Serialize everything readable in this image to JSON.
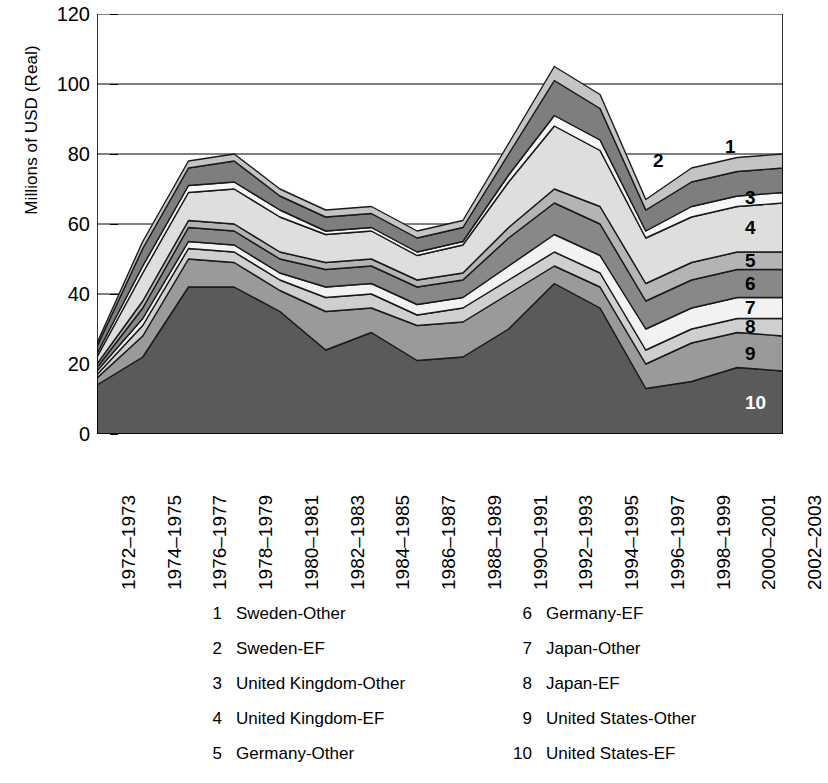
{
  "axes": {
    "y_title": "Millions of USD (Real)",
    "y_ticks": [
      "0",
      "20",
      "40",
      "60",
      "80",
      "100",
      "120"
    ],
    "x_ticks": [
      "1972–1973",
      "1974–1975",
      "1976–1977",
      "1978–1979",
      "1980–1981",
      "1982–1983",
      "1984–1985",
      "1986–1987",
      "1988–1989",
      "1990–1991",
      "1992–1993",
      "1994–1995",
      "1996–1997",
      "1998–1999",
      "2000–2001",
      "2002–2003"
    ]
  },
  "series_labels": {
    "s1": "1",
    "s2": "2",
    "s3": "3",
    "s4": "4",
    "s5": "5",
    "s6": "6",
    "s7": "7",
    "s8": "8",
    "s9": "9",
    "s10": "10"
  },
  "legend": {
    "left": [
      {
        "num": "1",
        "label": "Sweden-Other"
      },
      {
        "num": "2",
        "label": "Sweden-EF"
      },
      {
        "num": "3",
        "label": "United Kingdom-Other"
      },
      {
        "num": "4",
        "label": "United Kingdom-EF"
      },
      {
        "num": "5",
        "label": "Germany-Other"
      }
    ],
    "right": [
      {
        "num": "6",
        "label": "Germany-EF"
      },
      {
        "num": "7",
        "label": "Japan-Other"
      },
      {
        "num": "8",
        "label": "Japan-EF"
      },
      {
        "num": "9",
        "label": "United States-Other"
      },
      {
        "num": "10",
        "label": "United States-EF"
      }
    ]
  },
  "chart_data": {
    "type": "area",
    "stacked": true,
    "title": "",
    "xlabel": "",
    "ylabel": "Millions of USD (Real)",
    "ylim": [
      0,
      120
    ],
    "ytick_step": 20,
    "grid": "horizontal",
    "legend_position": "below",
    "categories": [
      "1972–1973",
      "1974–1975",
      "1976–1977",
      "1978–1979",
      "1980–1981",
      "1982–1983",
      "1984–1985",
      "1986–1987",
      "1988–1989",
      "1990–1991",
      "1992–1993",
      "1994–1995",
      "1996–1997",
      "1998–1999",
      "2000–2001",
      "2002–2003"
    ],
    "stack_order_bottom_to_top": [
      "United States-EF",
      "United States-Other",
      "Japan-EF",
      "Japan-Other",
      "Germany-EF",
      "Germany-Other",
      "United Kingdom-EF",
      "United Kingdom-Other",
      "Sweden-EF",
      "Sweden-Other"
    ],
    "series": [
      {
        "name": "United States-EF",
        "key": "10",
        "color": "#5a5a5a",
        "values": [
          14,
          22,
          42,
          42,
          35,
          24,
          29,
          21,
          22,
          30,
          43,
          36,
          13,
          15,
          19,
          18
        ]
      },
      {
        "name": "United States-Other",
        "key": "9",
        "color": "#9a9a9a",
        "values": [
          2,
          6,
          8,
          7,
          6,
          11,
          7,
          10,
          10,
          10,
          5,
          6,
          7,
          11,
          10,
          10
        ]
      },
      {
        "name": "Japan-EF",
        "key": "8",
        "color": "#cfcfcf",
        "values": [
          1,
          3,
          3,
          3,
          3,
          4,
          4,
          3,
          4,
          4,
          4,
          4,
          4,
          4,
          4,
          5
        ]
      },
      {
        "name": "Japan-Other",
        "key": "7",
        "color": "#f2f2f2",
        "values": [
          1,
          2,
          2,
          2,
          2,
          3,
          3,
          3,
          3,
          4,
          5,
          5,
          6,
          6,
          6,
          6
        ]
      },
      {
        "name": "Germany-EF",
        "key": "6",
        "color": "#888888",
        "values": [
          1,
          3,
          4,
          4,
          4,
          5,
          5,
          5,
          5,
          8,
          9,
          9,
          8,
          8,
          8,
          8
        ]
      },
      {
        "name": "Germany-Other",
        "key": "5",
        "color": "#b4b4b4",
        "values": [
          1,
          2,
          2,
          2,
          2,
          2,
          2,
          2,
          2,
          3,
          4,
          5,
          5,
          5,
          5,
          5
        ]
      },
      {
        "name": "United Kingdom-EF",
        "key": "4",
        "color": "#dedede",
        "values": [
          2,
          8,
          8,
          10,
          10,
          8,
          8,
          7,
          8,
          13,
          18,
          16,
          13,
          13,
          13,
          14
        ]
      },
      {
        "name": "United Kingdom-Other",
        "key": "3",
        "color": "#f7f7f7",
        "values": [
          1,
          2,
          2,
          2,
          2,
          1,
          1,
          1,
          1,
          2,
          3,
          3,
          2,
          3,
          3,
          3
        ],
        "note": "narrow band"
      },
      {
        "name": "Sweden-EF",
        "key": "2",
        "color": "#7e7e7e",
        "values": [
          2,
          5,
          5,
          6,
          4,
          4,
          4,
          4,
          4,
          6,
          10,
          9,
          6,
          7,
          7,
          7
        ]
      },
      {
        "name": "Sweden-Other",
        "key": "1",
        "color": "#c4c4c4",
        "values": [
          1,
          2,
          2,
          2,
          2,
          2,
          2,
          2,
          2,
          3,
          4,
          4,
          3,
          4,
          4,
          4
        ]
      }
    ],
    "totals": [
      26,
      55,
      78,
      80,
      70,
      64,
      65,
      58,
      61,
      83,
      105,
      97,
      67,
      76,
      79,
      80
    ],
    "annotations": [
      {
        "text": "1",
        "series": "Sweden-Other"
      },
      {
        "text": "2",
        "series": "Sweden-EF"
      },
      {
        "text": "3",
        "series": "United Kingdom-Other"
      },
      {
        "text": "4",
        "series": "United Kingdom-EF"
      },
      {
        "text": "5",
        "series": "Germany-Other"
      },
      {
        "text": "6",
        "series": "Germany-EF"
      },
      {
        "text": "7",
        "series": "Japan-Other"
      },
      {
        "text": "8",
        "series": "Japan-EF"
      },
      {
        "text": "9",
        "series": "United States-Other"
      },
      {
        "text": "10",
        "series": "United States-EF"
      }
    ]
  }
}
